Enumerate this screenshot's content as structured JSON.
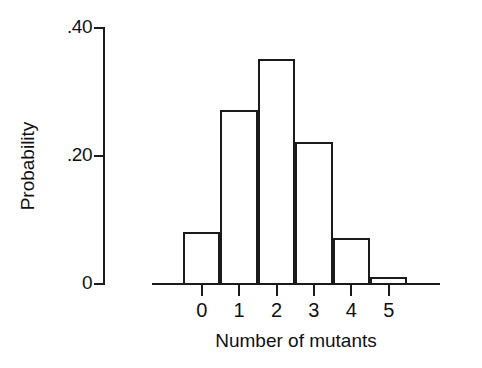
{
  "chart_data": {
    "type": "bar",
    "title": "",
    "subtitle": "",
    "xlabel": "Number of mutants",
    "ylabel": "Probability",
    "categories": [
      "0",
      "1",
      "2",
      "3",
      "4",
      "5"
    ],
    "values": [
      0.08,
      0.27,
      0.35,
      0.22,
      0.07,
      0.01
    ],
    "series": [
      {
        "name": "Probability",
        "values": [
          0.08,
          0.27,
          0.35,
          0.22,
          0.07,
          0.01
        ]
      }
    ],
    "ylim": [
      0,
      0.4
    ],
    "xlim": [
      -0.5,
      5.5
    ],
    "y_ticks": [
      0,
      0.2,
      0.4
    ],
    "y_tick_labels": [
      "0",
      ".20",
      ".40"
    ],
    "x_ticks": [
      0,
      1,
      2,
      3,
      4,
      5
    ],
    "x_tick_labels": [
      "0",
      "1",
      "2",
      "3",
      "4",
      "5"
    ],
    "grid": false,
    "legend": false,
    "legend_position": "none",
    "bar_style": "histogram-outline",
    "bar_fill": "#ffffff",
    "bar_stroke": "#1a1a1a",
    "axis_color": "#1a1a1a",
    "background": "#ffffff",
    "annotations": []
  },
  "axes": {
    "y": {
      "title": "Probability",
      "ticks": [
        {
          "label": ".40",
          "value": 0.4
        },
        {
          "label": ".20",
          "value": 0.2
        },
        {
          "label": "0",
          "value": 0
        }
      ]
    },
    "x": {
      "title": "Number of mutants",
      "ticks": [
        {
          "label": "0",
          "value": 0
        },
        {
          "label": "1",
          "value": 1
        },
        {
          "label": "2",
          "value": 2
        },
        {
          "label": "3",
          "value": 3
        },
        {
          "label": "4",
          "value": 4
        },
        {
          "label": "5",
          "value": 5
        }
      ]
    }
  }
}
